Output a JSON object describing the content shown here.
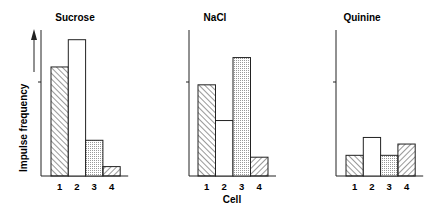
{
  "chart_data": {
    "type": "bar",
    "ylabel": "Impulse frequency",
    "xlabel": "Cell",
    "ylim": [
      0,
      1.55
    ],
    "grid": false,
    "legend": null,
    "categories": [
      "1",
      "2",
      "3",
      "4"
    ],
    "panels": [
      {
        "title": "Sucrose",
        "values": [
          1.16,
          1.45,
          0.38,
          0.1
        ]
      },
      {
        "title": "NaCl",
        "values": [
          0.97,
          0.59,
          1.26,
          0.2
        ]
      },
      {
        "title": "Quinine",
        "values": [
          0.22,
          0.41,
          0.22,
          0.34
        ]
      }
    ],
    "bar_fills": [
      "hatch-back",
      "white",
      "dotted",
      "hatch-forward"
    ],
    "units": "relative (y-axis tick mark = 1.0)"
  }
}
